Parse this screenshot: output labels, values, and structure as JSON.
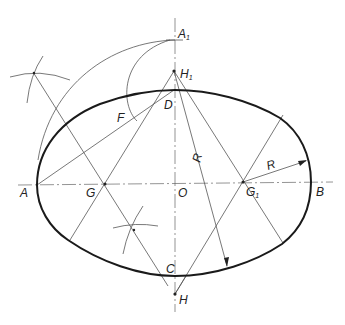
{
  "diagram": {
    "type": "geometric-construction",
    "labels": {
      "A": "A",
      "A1": "A",
      "A1_sub": "1",
      "B": "B",
      "C": "C",
      "D": "D",
      "F": "F",
      "G": "G",
      "G1": "G",
      "G1_sub": "1",
      "H": "H",
      "H1": "H",
      "H1_sub": "1",
      "O": "O",
      "R_right": "R",
      "R_long": "R"
    },
    "colors": {
      "background": "#ffffff",
      "outline": "#1a1a1a",
      "construction": "#555555"
    }
  }
}
